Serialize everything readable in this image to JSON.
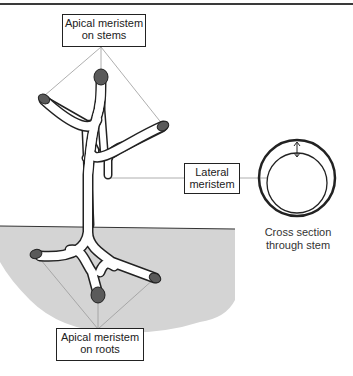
{
  "diagram": {
    "type": "plant meristem locations",
    "labels": {
      "apical_stems": {
        "line1": "Apical meristem",
        "line2": "on stems"
      },
      "lateral": {
        "line1": "Lateral",
        "line2": "meristem"
      },
      "apical_roots": {
        "line1": "Apical meristem",
        "line2": "on roots"
      },
      "cross_section": {
        "line1": "Cross section",
        "line2": "through stem"
      }
    },
    "colors": {
      "soil": "#d4d4d4",
      "meristem_tip": "#5a5a5a",
      "outline": "#222222",
      "leader_line": "#9a9a9a"
    }
  }
}
